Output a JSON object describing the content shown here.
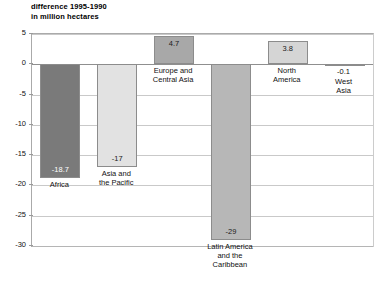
{
  "chart_data": {
    "type": "bar",
    "title": "difference 1995-1990\nin million hectares",
    "xlabel": "",
    "ylabel": "",
    "ylim": [
      -30,
      5
    ],
    "yticks": [
      "5",
      "0",
      "-5",
      "-10",
      "-15",
      "-20",
      "-25",
      "-30"
    ],
    "grid": true,
    "legend": "none",
    "categories": [
      "Africa",
      "Asia and\nthe Pacific",
      "Europe and\nCentral Asia",
      "Latin America\nand the\nCaribbean",
      "North\nAmerica",
      "West\nAsia"
    ],
    "values": [
      -18.7,
      -17,
      4.7,
      -29,
      3.8,
      -0.1
    ],
    "value_labels": [
      "-18.7",
      "-17",
      "4.7",
      "-29",
      "3.8",
      "-0.1"
    ],
    "bar_colors": [
      "#7a7a7a",
      "#e2e2e2",
      "#a8a8a8",
      "#b7b7b7",
      "#d5d5d5",
      "#c4c4c4"
    ],
    "label_colors": [
      "#ffffff",
      "#1a1a1a",
      "#1a1a1a",
      "#1a1a1a",
      "#1a1a1a",
      "#1a1a1a"
    ],
    "axis_color": "#8f8f8f",
    "grid_color": "#c9c9c9"
  },
  "footer": {
    "source_text": ""
  }
}
